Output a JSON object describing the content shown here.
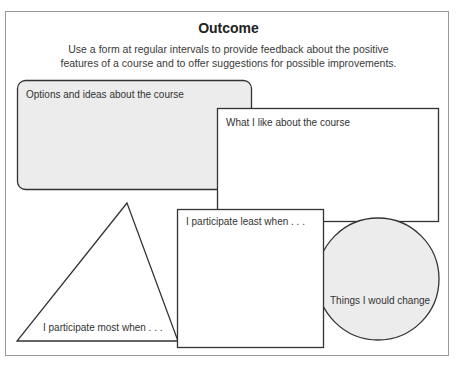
{
  "header": {
    "title": "Outcome",
    "description_line1": "Use a form at regular intervals to provide feedback about the positive",
    "description_line2": "features of a course and to offer suggestions for possible improvements."
  },
  "shapes": {
    "rounded_box": {
      "label": "Options and ideas about the course",
      "fill": "#ececec"
    },
    "rectangle_top": {
      "label": "What I like about the course",
      "fill": "#ffffff"
    },
    "triangle": {
      "label": "I participate most when . . .",
      "fill": "#ffffff"
    },
    "square": {
      "label": "I participate least when . . .",
      "fill": "#ffffff"
    },
    "circle": {
      "label": "Things I would change",
      "fill": "#ececec"
    }
  },
  "colors": {
    "stroke": "#333333",
    "frame": "#9a9a9a"
  }
}
